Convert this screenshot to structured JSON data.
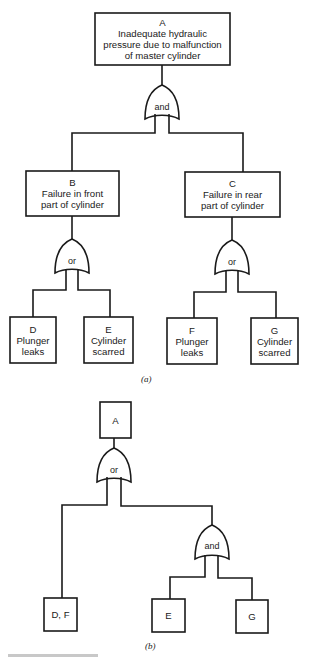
{
  "diagram_a": {
    "caption": "(a)",
    "top_event": {
      "id": "A",
      "text": [
        "Inadequate hydraulic",
        "pressure due to malfunction",
        "of master cylinder"
      ]
    },
    "top_gate": "and",
    "intermediate": [
      {
        "id": "B",
        "text": [
          "Failure in front",
          "part of cylinder"
        ],
        "gate": "or"
      },
      {
        "id": "C",
        "text": [
          "Failure in rear",
          "part of cylinder"
        ],
        "gate": "or"
      }
    ],
    "basic": [
      {
        "id": "D",
        "text": [
          "Plunger",
          "leaks"
        ]
      },
      {
        "id": "E",
        "text": [
          "Cylinder",
          "scarred"
        ]
      },
      {
        "id": "F",
        "text": [
          "Plunger",
          "leaks"
        ]
      },
      {
        "id": "G",
        "text": [
          "Cylinder",
          "scarred"
        ]
      }
    ]
  },
  "diagram_b": {
    "caption": "(b)",
    "top_event": {
      "id": "A"
    },
    "top_gate": "or",
    "sub_gate": "and",
    "basic": [
      {
        "id": "D, F"
      },
      {
        "id": "E"
      },
      {
        "id": "G"
      }
    ]
  }
}
